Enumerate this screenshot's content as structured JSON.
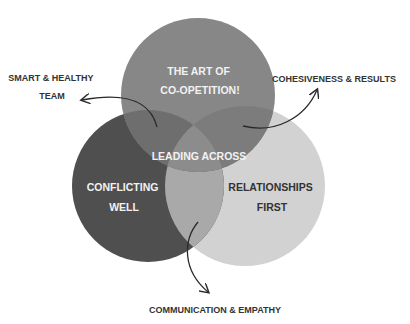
{
  "diagram": {
    "circles": [
      {
        "id": "top",
        "label_lines": [
          "THE ART OF",
          "CO-OPETITION!"
        ],
        "color": "#878787"
      },
      {
        "id": "left",
        "label_lines": [
          "CONFLICTING",
          "WELL"
        ],
        "color": "#4f4f4f"
      },
      {
        "id": "right",
        "label_lines": [
          "RELATIONSHIPS",
          "FIRST"
        ],
        "color": "#d2d2d2"
      }
    ],
    "center_label": "LEADING ACROSS",
    "outcomes": [
      {
        "id": "top-left",
        "label_lines": [
          "SMART & HEALTHY",
          "TEAM"
        ]
      },
      {
        "id": "top-right",
        "label_lines": [
          "COHESIVENESS & RESULTS"
        ]
      },
      {
        "id": "bottom",
        "label_lines": [
          "COMMUNICATION & EMPATHY"
        ]
      }
    ],
    "colors": {
      "top_left_overlap": "#6e6e6e",
      "top_right_overlap": "#a6a6a6",
      "left_right_overlap": "#a9a9a9",
      "center": "#8c8c8c",
      "light_text": "#f2f2f2",
      "dark_text": "#333333",
      "arrow": "#2a2a2a"
    }
  }
}
